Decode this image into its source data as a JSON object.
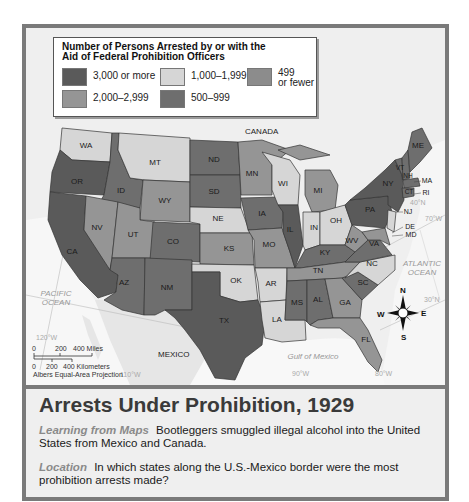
{
  "legend": {
    "title_line1": "Number of Persons Arrested by or with the",
    "title_line2": "Aid of Federal Prohibition Officers",
    "categories": [
      {
        "key": "c3000",
        "label": "3,000 or more",
        "color": "#5a5a5a"
      },
      {
        "key": "c1000",
        "label": "1,000–1,999",
        "color": "#d6d6d6"
      },
      {
        "key": "c499",
        "label_line1": "499",
        "label_line2": "or fewer",
        "color": "#8c8c8c"
      },
      {
        "key": "c2000",
        "label": "2,000–2,999",
        "color": "#959595"
      },
      {
        "key": "c500",
        "label": "500–999",
        "color": "#6e6e6e"
      }
    ]
  },
  "map": {
    "labels": {
      "canada": "CANADA",
      "mexico": "MEXICO",
      "pacific_1": "PACIFIC",
      "pacific_2": "OCEAN",
      "atlantic_1": "ATLANTIC",
      "atlantic_2": "OCEAN",
      "gulf": "Gulf of Mexico"
    },
    "graticule": {
      "w120": "120°W",
      "w110": "110°W",
      "w90": "90°W",
      "w80": "80°W",
      "w70": "70°W",
      "n40": "40°N",
      "n30": "30°N"
    },
    "scale": {
      "miles_ticks": [
        "0",
        "200",
        "400 Miles"
      ],
      "km_ticks": [
        "0",
        "200",
        "400 Kilometers"
      ],
      "projection": "Albers Equal-Area Projection"
    },
    "compass": {
      "n": "N",
      "s": "S",
      "e": "E",
      "w": "W"
    },
    "states": {
      "WA": "WA",
      "OR": "OR",
      "CA": "CA",
      "ID": "ID",
      "NV": "NV",
      "MT": "MT",
      "WY": "WY",
      "UT": "UT",
      "AZ": "AZ",
      "CO": "CO",
      "NM": "NM",
      "ND": "ND",
      "SD": "SD",
      "NE": "NE",
      "KS": "KS",
      "OK": "OK",
      "TX": "TX",
      "MN": "MN",
      "IA": "IA",
      "MO": "MO",
      "AR": "AR",
      "LA": "LA",
      "WI": "WI",
      "IL": "IL",
      "MI": "MI",
      "IN": "IN",
      "OH": "OH",
      "KY": "KY",
      "TN": "TN",
      "MS": "MS",
      "AL": "AL",
      "GA": "GA",
      "FL": "FL",
      "SC": "SC",
      "NC": "NC",
      "VA": "VA",
      "WV": "WV",
      "PA": "PA",
      "NY": "NY",
      "VT": "VT",
      "NH": "NH",
      "ME": "ME",
      "MA": "MA",
      "CT": "CT",
      "RI": "RI",
      "NJ": "NJ",
      "DE": "DE",
      "MD": "MD"
    }
  },
  "caption": {
    "title": "Arrests Under Prohibition, 1929",
    "lead1": "Learning from Maps",
    "text1": "Bootleggers smuggled illegal alcohol into the United States from Mexico and Canada.",
    "lead2": "Location",
    "text2": "In which states along the U.S.-Mexico border were the most prohibition arrests made?"
  }
}
